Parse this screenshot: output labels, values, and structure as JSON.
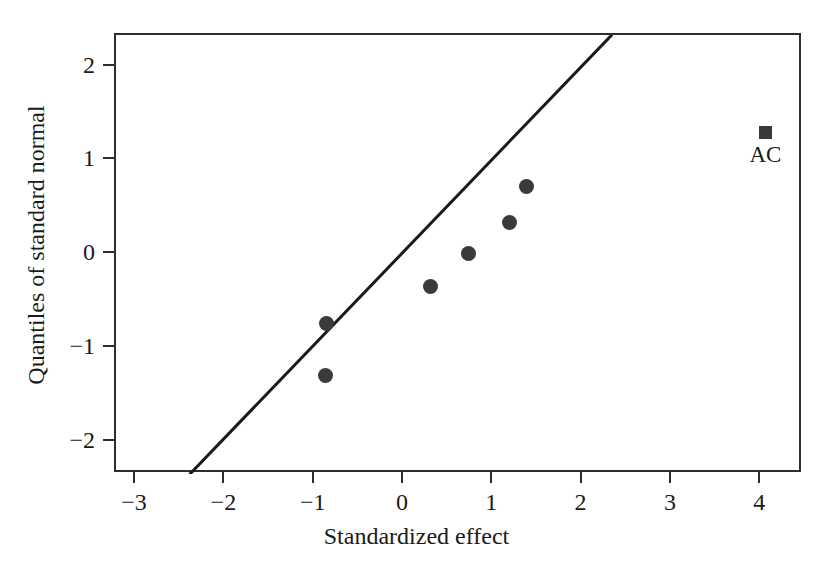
{
  "chart_data": {
    "type": "scatter",
    "title": "",
    "subtitle": "",
    "xlabel": "Standardized effect",
    "ylabel": "Quantiles of standard normal",
    "xlim": [
      -3.22,
      4.47
    ],
    "ylim": [
      -2.35,
      2.34
    ],
    "xticks": [
      -3,
      -2,
      -1,
      0,
      1,
      2,
      3,
      4
    ],
    "xticklabels": [
      "−3",
      "−2",
      "−1",
      "0",
      "1",
      "2",
      "3",
      "4"
    ],
    "yticks": [
      -2,
      -1,
      0,
      1,
      2
    ],
    "yticklabels": [
      "−2",
      "−1",
      "0",
      "1",
      "2"
    ],
    "grid": false,
    "legend": "none",
    "marker_color": "#3a3a3a",
    "line_color": "#1a1a1a",
    "frame_color": "#2e2e2e",
    "points": [
      {
        "x": -0.86,
        "y": -1.32,
        "marker": "circle",
        "label": ""
      },
      {
        "x": -0.84,
        "y": -0.76,
        "marker": "circle",
        "label": ""
      },
      {
        "x": 0.32,
        "y": -0.37,
        "marker": "circle",
        "label": ""
      },
      {
        "x": 0.74,
        "y": -0.02,
        "marker": "circle",
        "label": ""
      },
      {
        "x": 1.2,
        "y": 0.31,
        "marker": "circle",
        "label": ""
      },
      {
        "x": 1.39,
        "y": 0.7,
        "marker": "circle",
        "label": ""
      },
      {
        "x": 4.07,
        "y": 1.28,
        "marker": "square",
        "label": "AC"
      }
    ],
    "reference_line": {
      "x0": -2.4,
      "y0": -2.35,
      "x1": 2.33,
      "y1": 2.34,
      "width": 3
    }
  }
}
